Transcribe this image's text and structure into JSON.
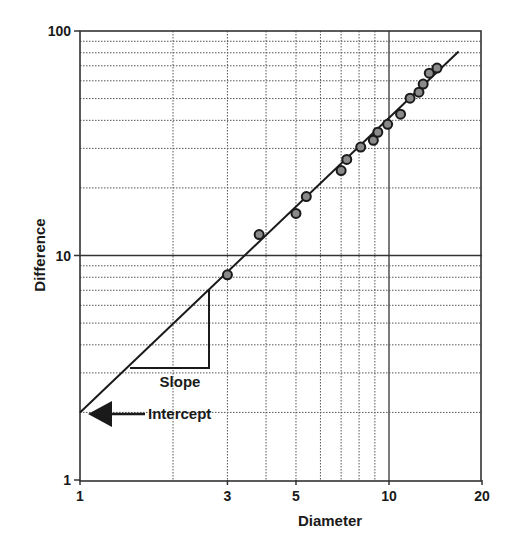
{
  "chart_data": {
    "type": "scatter",
    "title": "",
    "xlabel": "Diameter",
    "ylabel": "Difference",
    "xscale": "log",
    "yscale": "log",
    "xlim": [
      1,
      20
    ],
    "ylim": [
      1,
      100
    ],
    "x_ticks": [
      1,
      3,
      5,
      10,
      20
    ],
    "x_tick_labels": [
      "1",
      "3",
      "5",
      "10",
      "20"
    ],
    "y_ticks": [
      1,
      10,
      100
    ],
    "y_tick_labels": [
      "1",
      "10",
      "100"
    ],
    "grid": true,
    "x_gridlines": [
      2,
      3,
      4,
      5,
      6,
      7,
      8,
      9,
      10
    ],
    "y_gridlines": [
      2,
      3,
      4,
      5,
      6,
      7,
      8,
      9,
      10,
      20,
      30,
      40,
      50,
      60,
      70,
      80,
      90
    ],
    "series": [
      {
        "name": "Observations",
        "kind": "scatter",
        "x": [
          3.0,
          3.8,
          5.0,
          5.4,
          7.0,
          7.3,
          8.1,
          8.9,
          9.2,
          9.9,
          10.9,
          11.7,
          12.5,
          12.9,
          13.5,
          14.3
        ],
        "y": [
          8.2,
          12.4,
          15.4,
          18.3,
          23.9,
          26.8,
          30.4,
          32.6,
          35.4,
          38.4,
          42.6,
          50.2,
          53.4,
          58.0,
          64.9,
          68.4
        ]
      },
      {
        "name": "Fitted line",
        "kind": "line",
        "x": [
          1,
          16.8
        ],
        "y": [
          2.0,
          81.0
        ]
      }
    ],
    "fit": {
      "intercept": 2.0,
      "slope": 1.31
    },
    "annotations": [
      {
        "text": "Slope",
        "type": "slope-triangle"
      },
      {
        "text": "Intercept",
        "type": "arrow",
        "points_to": [
          1,
          2
        ]
      }
    ]
  },
  "labels": {
    "xlabel": "Diameter",
    "ylabel": "Difference",
    "slope": "Slope",
    "intercept": "Intercept"
  }
}
